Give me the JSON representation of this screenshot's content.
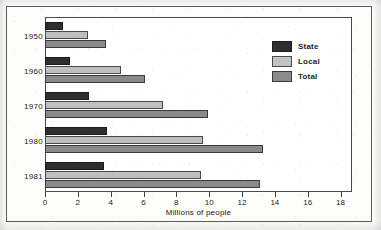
{
  "chart_data": {
    "type": "bar",
    "orientation": "horizontal",
    "title": "",
    "xlabel": "Millions of people",
    "ylabel": "",
    "categories": [
      "1950",
      "1960",
      "1970",
      "1980",
      "1981"
    ],
    "series": [
      {
        "name": "State",
        "color": "#2e2e2e",
        "values": [
          1.1,
          1.5,
          2.7,
          3.8,
          3.6
        ]
      },
      {
        "name": "Local",
        "color": "#bfbfbf",
        "values": [
          2.6,
          4.6,
          7.2,
          9.6,
          9.5
        ]
      },
      {
        "name": "Total",
        "color": "#8a8a8a",
        "values": [
          3.7,
          6.1,
          9.9,
          13.3,
          13.1
        ]
      }
    ],
    "xlim": [
      0,
      18.7
    ],
    "xticks": [
      0,
      2,
      4,
      6,
      8,
      10,
      12,
      14,
      16,
      18
    ],
    "xticklabels": [
      "0",
      "2",
      "4",
      "6",
      "8",
      "10",
      "12",
      "14",
      "16",
      "18"
    ],
    "grid": false,
    "legend_position": "upper right"
  },
  "legend": {
    "items": [
      {
        "label": "State",
        "swatch": "state"
      },
      {
        "label": "Local",
        "swatch": "local"
      },
      {
        "label": "Total",
        "swatch": "total"
      }
    ]
  },
  "axis": {
    "x_title": "Millions of people"
  }
}
